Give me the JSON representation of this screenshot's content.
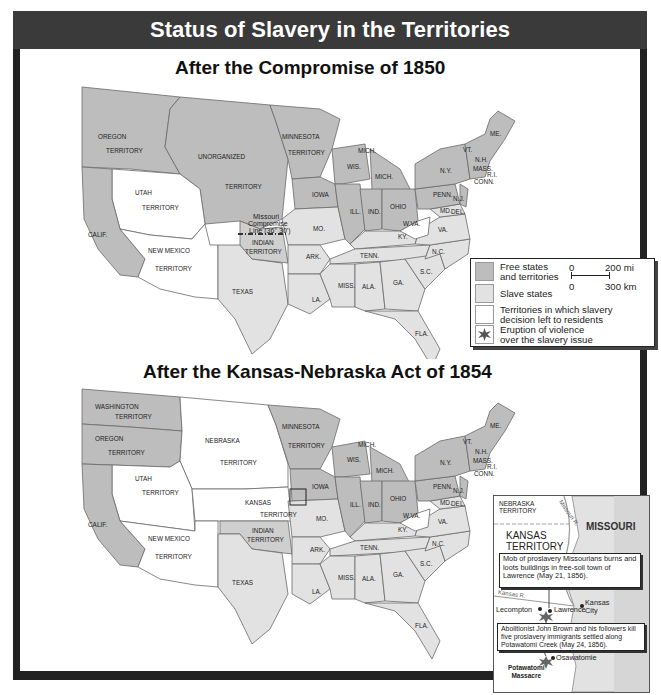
{
  "header": {
    "title": "Status of Slavery in the Territories"
  },
  "colors": {
    "frame": "#222222",
    "header_bg": "#3a3a3a",
    "free": "#bdbdbd",
    "slave": "#e2e2e2",
    "popular_sovereignty": "#ffffff",
    "indian_territory": "#cfcfcf",
    "border": "#6a6a6a"
  },
  "map1": {
    "title": "After the Compromise of 1850",
    "labels": {
      "oregon": "OREGON",
      "oregon_terr": "TERRITORY",
      "unorganized": "UNORGANIZED",
      "unorganized_terr": "TERRITORY",
      "minnesota": "MINNESOTA",
      "minnesota_terr": "TERRITORY",
      "utah": "UTAH",
      "utah_terr": "TERRITORY",
      "calif": "CALIF.",
      "newmexico": "NEW MEXICO",
      "newmexico_terr": "TERRITORY",
      "texas": "TEXAS",
      "indian": "INDIAN",
      "indian_terr": "TERRITORY",
      "mcl1": "Missouri",
      "mcl2": "Compromise",
      "mcl3": "Line (36° 30')",
      "iowa": "IOWA",
      "wis": "WIS.",
      "mich1": "MICH.",
      "mich2": "MICH.",
      "ill": "ILL.",
      "ind": "IND.",
      "ohio": "OHIO",
      "mo": "MO.",
      "ky": "KY.",
      "tenn": "TENN.",
      "ark": "ARK.",
      "la": "LA.",
      "miss": "MISS.",
      "ala": "ALA.",
      "ga": "GA.",
      "fla": "FLA.",
      "sc": "S.C.",
      "nc": "N.C.",
      "va": "VA.",
      "wva": "W.VA.",
      "md": "MD.",
      "del": "DEL.",
      "nj": "N.J.",
      "penn": "PENN.",
      "ny": "N.Y.",
      "vt": "VT.",
      "nh": "N.H.",
      "mass": "MASS.",
      "ri": "R.I.",
      "conn": "CONN.",
      "me": "ME."
    }
  },
  "legend": {
    "free": "Free states and territories",
    "free_l1": "Free states",
    "free_l2": "and territories",
    "slave": "Slave states",
    "ps_l1": "Territories in which slavery",
    "ps_l2": "decision left to residents",
    "violence_l1": "Eruption of violence",
    "violence_l2": "over the slavery issue",
    "scale_mi_0": "0",
    "scale_mi": "200 mi",
    "scale_km_0": "0",
    "scale_km": "300 km"
  },
  "map2": {
    "title": "After the Kansas-Nebraska Act of 1854",
    "labels": {
      "washington": "WASHINGTON",
      "washington_terr": "TERRITORY",
      "oregon": "OREGON",
      "oregon_terr": "TERRITORY",
      "nebraska": "NEBRASKA",
      "nebraska_terr": "TERRITORY",
      "minnesota": "MINNESOTA",
      "minnesota_terr": "TERRITORY",
      "utah": "UTAH",
      "utah_terr": "TERRITORY",
      "kansas": "KANSAS",
      "kansas_terr": "TERRITORY",
      "calif": "CALIF.",
      "newmexico": "NEW MEXICO",
      "newmexico_terr": "TERRITORY",
      "indian": "INDIAN",
      "indian_terr": "TERRITORY",
      "texas": "TEXAS",
      "iowa": "IOWA",
      "wis": "WIS.",
      "mich1": "MICH.",
      "mich2": "MICH.",
      "ill": "ILL.",
      "ind": "IND.",
      "ohio": "OHIO",
      "mo": "MO.",
      "ky": "KY.",
      "tenn": "TENN.",
      "ark": "ARK.",
      "la": "LA.",
      "miss": "MISS.",
      "ala": "ALA.",
      "ga": "GA.",
      "fla": "FLA.",
      "sc": "S.C.",
      "nc": "N.C.",
      "va": "VA.",
      "wva": "W.VA.",
      "md": "MD.",
      "del": "DEL.",
      "nj": "N.J.",
      "penn": "PENN.",
      "ny": "N.Y.",
      "vt": "VT.",
      "nh": "N.H.",
      "mass": "MASS.",
      "ri": "R.I.",
      "conn": "CONN.",
      "me": "ME."
    }
  },
  "inset": {
    "nebraska_l1": "NEBRASKA",
    "nebraska_l2": "TERRITORY",
    "missouri_r": "Missouri R.",
    "kansas_terr_l1": "KANSAS",
    "kansas_terr_l2": "TERRITORY",
    "missouri": "MISSOURI",
    "kansas_r": "Kansas R.",
    "callout1": "Mob of proslavery Missourians burns and loots buildings in free-soil town of Lawrence (May 21, 1856).",
    "lecompton": "Lecompton",
    "lawrence": "Lawrence",
    "kansas_city_l1": "Kansas",
    "kansas_city_l2": "City",
    "callout2": "Abolitionist John Brown and his followers kill five proslavery immigrants settled along Potawatomi Creek (May 24, 1856).",
    "osawatomie": "Osawatomie",
    "massacre_l1": "Potawatomi",
    "massacre_l2": "Massacre"
  }
}
